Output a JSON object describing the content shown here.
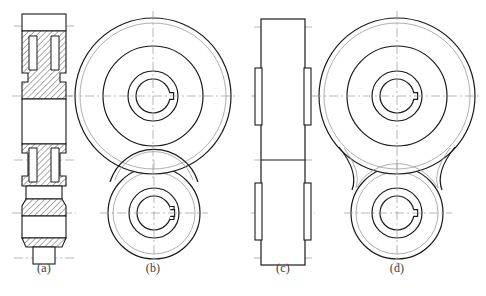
{
  "figure": {
    "kind": "engineering-orthographic-drawing",
    "title": "",
    "caption": "",
    "background_color": "#ffffff",
    "visible_line_color": "#1a1a1a",
    "center_line_color": "#9a9a9a",
    "hidden_line_color": "#9a9a9a",
    "hatch_color": "#4a4a4a",
    "label_color": "#3b3b3b"
  },
  "labels": [
    {
      "id": "a",
      "text": "(a)",
      "x": 44,
      "y": 262
    },
    {
      "id": "b",
      "text": "(b)",
      "x": 153,
      "y": 262
    },
    {
      "id": "c",
      "text": "(c)",
      "x": 283,
      "y": 262
    },
    {
      "id": "d",
      "text": "(d)",
      "x": 397,
      "y": 262
    }
  ],
  "views": {
    "a": {
      "name": "full-section-front-view",
      "description": "Sectioned front view of a two-gear shaft assembly with hatched webs, stepped hubs and a plain shaft body.",
      "center_x": 44,
      "axes_y": [
        26,
        96,
        160,
        213,
        258
      ],
      "outline_top": 14,
      "outline_bottom": 258,
      "half_width_outer": 22,
      "half_width_hub": 16,
      "half_width_shaft": 11,
      "hatched": true,
      "hatch_angle_deg": 45,
      "hatch_spacing": 3
    },
    "b": {
      "name": "side-view-sectioned-gears",
      "description": "Side view of the two gears as concentric circles; the larger gear overlaps the smaller one, both bores show a keyway.",
      "upper": {
        "center_x": 153,
        "center_y": 96,
        "radii": [
          78,
          73,
          50,
          25,
          17
        ],
        "keyway_width": 5,
        "keyway_depth": 4,
        "keyway_side": "right"
      },
      "lower": {
        "center_x": 154,
        "center_y": 213,
        "radii": [
          46,
          41,
          25,
          17
        ],
        "keyway_width": 5,
        "keyway_depth": 4,
        "keyway_side": "right"
      }
    },
    "c": {
      "name": "outline-side-view",
      "description": "Outline (non-sectioned) side elevation showing overall width, two recessed rim bands and the parting line.",
      "center_x": 283,
      "axes_y": [
        27,
        96,
        160,
        213,
        258
      ],
      "outline_top": 19,
      "outline_bottom": 265,
      "half_width_outer": 22,
      "half_width_rim": 17,
      "parting_y": 160
    },
    "d": {
      "name": "alternate-side-view-with-web",
      "description": "Alternate side view where the two gear circles are joined by concave tangent fillets forming a connecting web.",
      "upper": {
        "center_x": 397,
        "center_y": 96,
        "radii": [
          78,
          73,
          50,
          25,
          17
        ],
        "keyway_width": 5,
        "keyway_depth": 4,
        "keyway_side": "right"
      },
      "lower": {
        "center_x": 397,
        "center_y": 213,
        "radii": [
          46,
          41,
          25,
          17
        ],
        "keyway_width": 5,
        "keyway_depth": 4,
        "keyway_side": "right"
      },
      "fillet_radius": 22
    }
  }
}
